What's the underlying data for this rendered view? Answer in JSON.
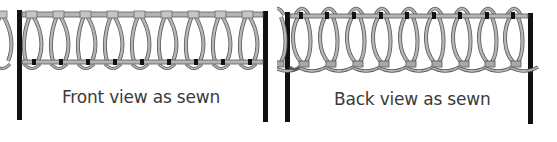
{
  "panels": [
    {
      "id": "front",
      "caption": "Front view as sewn",
      "loop_count": 9
    },
    {
      "id": "back",
      "caption": "Back view as sewn",
      "loop_count": 9
    }
  ],
  "colors": {
    "post": "#111111",
    "thread_fill": "#b5b5b5",
    "thread_outline": "#5a5a5a",
    "knot": "#111111",
    "caption": "#3a3a3a"
  }
}
